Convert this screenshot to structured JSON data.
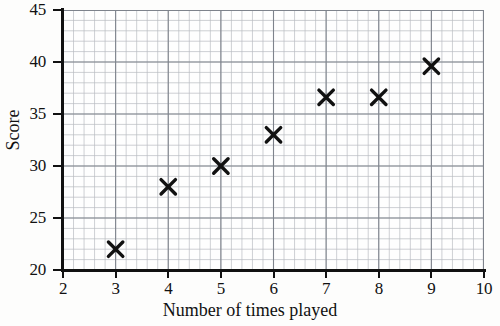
{
  "chart_data": {
    "type": "scatter",
    "title": "",
    "xlabel": "Number of times played",
    "ylabel": "Score",
    "xlim": [
      2,
      10
    ],
    "ylim": [
      20,
      45
    ],
    "x_ticks": [
      2,
      3,
      4,
      5,
      6,
      7,
      8,
      9,
      10
    ],
    "y_ticks": [
      20,
      25,
      30,
      35,
      40,
      45
    ],
    "x_tick_labels": [
      "2",
      "3",
      "4",
      "5",
      "6",
      "7",
      "8",
      "9",
      "10"
    ],
    "y_tick_labels": [
      "20",
      "25",
      "30",
      "35",
      "40",
      "45"
    ],
    "grid": true,
    "grid_minor": true,
    "grid_minor_step_x": 0.2,
    "grid_minor_step_y": 1,
    "grid_major_step_x": 1,
    "grid_major_step_y": 5,
    "legend": null,
    "marker": "x-cross",
    "marker_color": "#111111",
    "series": [
      {
        "name": "Score vs number of times played",
        "points": [
          {
            "x": 3,
            "y": 22
          },
          {
            "x": 4,
            "y": 28
          },
          {
            "x": 5,
            "y": 30
          },
          {
            "x": 6,
            "y": 33
          },
          {
            "x": 7,
            "y": 36.6
          },
          {
            "x": 8,
            "y": 36.6
          },
          {
            "x": 9,
            "y": 39.6
          }
        ]
      }
    ]
  },
  "style": {
    "axis_color": "#111111",
    "grid_minor_color": "#b9bcc2",
    "grid_major_color": "#7e838c",
    "background": "#fdfdfc",
    "plot_background": "#fefefe"
  }
}
